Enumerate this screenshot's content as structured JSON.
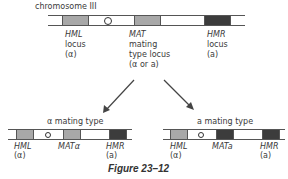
{
  "top": {
    "title": "chromosome III",
    "loci": [
      {
        "name": "HML",
        "line2": "locus",
        "line3": "(α)"
      },
      {
        "name": "MAT",
        "line2": "mating",
        "line3": "type locus",
        "line4": "(α or a)"
      },
      {
        "name": "HMR",
        "line2": "locus",
        "line3": "(a)"
      }
    ]
  },
  "left": {
    "title": "α mating type",
    "loci": [
      {
        "name": "HML",
        "allele": "(α)"
      },
      {
        "name": "MATα"
      },
      {
        "name": "HMR",
        "allele": "(a)"
      }
    ]
  },
  "right": {
    "title": "a mating type",
    "loci": [
      {
        "name": "HML",
        "allele": "(α)"
      },
      {
        "name": "MATa"
      },
      {
        "name": "HMR",
        "allele": "(a)"
      }
    ]
  },
  "caption": "Figure 23–12",
  "colors": {
    "alpha_box": "#a8a8a8",
    "a_box": "#3c3c3c",
    "line": "#555555"
  }
}
